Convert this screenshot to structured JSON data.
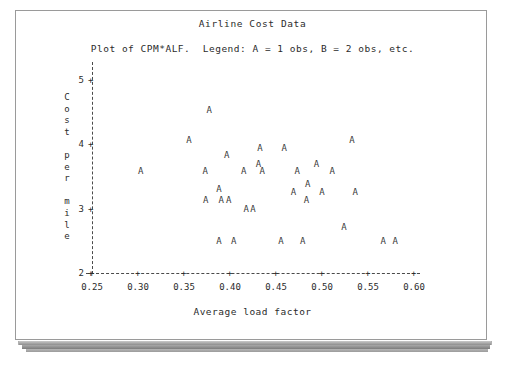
{
  "document": {
    "frame_border_color": "#9a9a9a",
    "background": "#ffffff"
  },
  "chart_data": {
    "type": "scatter",
    "title": "Airline Cost Data",
    "subtitle": "Plot of CPM*ALF.  Legend: A = 1 obs, B = 2 obs, etc.",
    "xlabel": "Average load factor",
    "ylabel": "Cost per mile",
    "ylabel_chars": [
      "C",
      "o",
      "s",
      "t",
      "",
      "p",
      "e",
      "r",
      "",
      "m",
      "i",
      "l",
      "e"
    ],
    "xlim": [
      0.25,
      0.6
    ],
    "ylim": [
      2,
      5
    ],
    "xticks": [
      "0.25",
      "0.30",
      "0.35",
      "0.40",
      "0.45",
      "0.50",
      "0.55",
      "0.60"
    ],
    "xtick_values": [
      0.25,
      0.3,
      0.35,
      0.4,
      0.45,
      0.5,
      0.55,
      0.6
    ],
    "yticks": [
      "5",
      "4",
      "3",
      "2"
    ],
    "ytick_values": [
      5,
      4,
      3,
      2
    ],
    "grid": false,
    "legend": "A = 1 obs, B = 2 obs, etc.",
    "marker_symbol": "A",
    "axis_style": "dashed",
    "points": [
      {
        "x": 0.3775,
        "y": 4.54
      },
      {
        "x": 0.3555,
        "y": 4.06
      },
      {
        "x": 0.5325,
        "y": 4.06
      },
      {
        "x": 0.4325,
        "y": 3.94
      },
      {
        "x": 0.459,
        "y": 3.94
      },
      {
        "x": 0.3965,
        "y": 3.84
      },
      {
        "x": 0.431,
        "y": 3.7
      },
      {
        "x": 0.494,
        "y": 3.7
      },
      {
        "x": 0.303,
        "y": 3.58
      },
      {
        "x": 0.373,
        "y": 3.58
      },
      {
        "x": 0.415,
        "y": 3.58
      },
      {
        "x": 0.435,
        "y": 3.58
      },
      {
        "x": 0.473,
        "y": 3.58
      },
      {
        "x": 0.511,
        "y": 3.58
      },
      {
        "x": 0.4845,
        "y": 3.39
      },
      {
        "x": 0.388,
        "y": 3.3
      },
      {
        "x": 0.469,
        "y": 3.26
      },
      {
        "x": 0.5,
        "y": 3.26
      },
      {
        "x": 0.536,
        "y": 3.26
      },
      {
        "x": 0.3735,
        "y": 3.14
      },
      {
        "x": 0.3905,
        "y": 3.14
      },
      {
        "x": 0.3985,
        "y": 3.14
      },
      {
        "x": 0.483,
        "y": 3.14
      },
      {
        "x": 0.4175,
        "y": 3.0
      },
      {
        "x": 0.425,
        "y": 3.0
      },
      {
        "x": 0.524,
        "y": 2.72
      },
      {
        "x": 0.388,
        "y": 2.5
      },
      {
        "x": 0.404,
        "y": 2.5
      },
      {
        "x": 0.4555,
        "y": 2.5
      },
      {
        "x": 0.479,
        "y": 2.5
      },
      {
        "x": 0.5665,
        "y": 2.5
      },
      {
        "x": 0.5795,
        "y": 2.5
      }
    ]
  }
}
